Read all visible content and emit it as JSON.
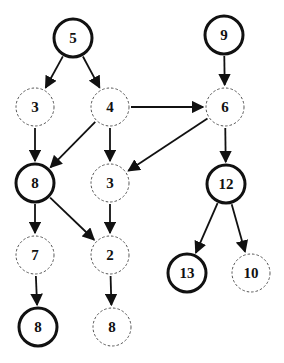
{
  "diagram": {
    "type": "directed-graph",
    "colors": {
      "stroke": "#111111",
      "dashed_stroke": "#555555",
      "background": "#ffffff"
    },
    "nodes": [
      {
        "id": "n5",
        "label": "5",
        "x": 73,
        "y": 38,
        "style": "bold"
      },
      {
        "id": "n9",
        "label": "9",
        "x": 224,
        "y": 35,
        "style": "bold"
      },
      {
        "id": "n3a",
        "label": "3",
        "x": 35,
        "y": 107,
        "style": "dashed"
      },
      {
        "id": "n4",
        "label": "4",
        "x": 110,
        "y": 107,
        "style": "dashed"
      },
      {
        "id": "n6",
        "label": "6",
        "x": 225,
        "y": 107,
        "style": "dashed"
      },
      {
        "id": "n8a",
        "label": "8",
        "x": 35,
        "y": 183,
        "style": "bold"
      },
      {
        "id": "n3b",
        "label": "3",
        "x": 110,
        "y": 183,
        "style": "dashed"
      },
      {
        "id": "n12",
        "label": "12",
        "x": 226,
        "y": 184,
        "style": "bold"
      },
      {
        "id": "n7",
        "label": "7",
        "x": 35,
        "y": 255,
        "style": "dashed"
      },
      {
        "id": "n2",
        "label": "2",
        "x": 110,
        "y": 255,
        "style": "dashed"
      },
      {
        "id": "n13",
        "label": "13",
        "x": 187,
        "y": 273,
        "style": "bold"
      },
      {
        "id": "n10",
        "label": "10",
        "x": 251,
        "y": 273,
        "style": "dashed"
      },
      {
        "id": "n8b",
        "label": "8",
        "x": 38,
        "y": 327,
        "style": "bold"
      },
      {
        "id": "n8c",
        "label": "8",
        "x": 112,
        "y": 327,
        "style": "dashed"
      }
    ],
    "edges": [
      {
        "from": "n5",
        "to": "n3a"
      },
      {
        "from": "n5",
        "to": "n4"
      },
      {
        "from": "n9",
        "to": "n6"
      },
      {
        "from": "n4",
        "to": "n6"
      },
      {
        "from": "n3a",
        "to": "n8a"
      },
      {
        "from": "n4",
        "to": "n8a"
      },
      {
        "from": "n4",
        "to": "n3b"
      },
      {
        "from": "n6",
        "to": "n3b"
      },
      {
        "from": "n6",
        "to": "n12"
      },
      {
        "from": "n8a",
        "to": "n7"
      },
      {
        "from": "n8a",
        "to": "n2"
      },
      {
        "from": "n3b",
        "to": "n2"
      },
      {
        "from": "n12",
        "to": "n13"
      },
      {
        "from": "n12",
        "to": "n10"
      },
      {
        "from": "n7",
        "to": "n8b"
      },
      {
        "from": "n2",
        "to": "n8c"
      }
    ],
    "node_radius": 19
  }
}
